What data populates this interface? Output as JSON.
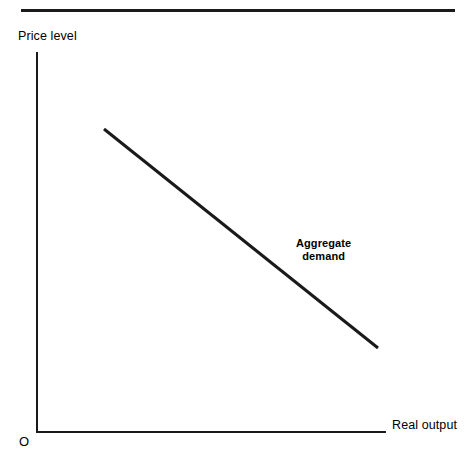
{
  "figure": {
    "background_color": "#ffffff",
    "ink_color": "#1a1a1a",
    "top_rule": "horizontal-rule"
  },
  "labels": {
    "y_axis": "Price level",
    "x_axis": "Real output",
    "origin": "O",
    "curve_line1": "Aggregate",
    "curve_line2": "demand"
  },
  "chart_data": {
    "type": "line",
    "title": "",
    "subtitle": "",
    "xlabel": "Real output",
    "ylabel": "Price level",
    "grid": false,
    "legend": false,
    "legend_position": "inline-annotation",
    "origin_label": "O",
    "axes": {
      "style": "L-shaped",
      "x_axis_pixels": {
        "x_start": 36,
        "x_end": 386,
        "y": 431
      },
      "y_axis_pixels": {
        "y_start": 52,
        "y_end": 431,
        "x": 36
      },
      "ticks": [],
      "tick_labels": [],
      "xlim": [
        0,
        1
      ],
      "ylim": [
        0,
        1
      ]
    },
    "series": [
      {
        "name": "Aggregate demand",
        "kind": "straight-downward-sloping-line",
        "color": "#1a1a1a",
        "line_width_px": 3,
        "annotation": "Aggregate demand",
        "points_pixels": [
          {
            "x": 104,
            "y": 129
          },
          {
            "x": 378,
            "y": 348
          }
        ],
        "points_normalized": [
          {
            "x": 0.19,
            "y": 0.8
          },
          {
            "x": 0.98,
            "y": 0.22
          }
        ],
        "slope_description": "negative"
      }
    ],
    "annotations": [
      {
        "text": "Aggregate demand",
        "bold": true,
        "lines": [
          "Aggregate",
          "demand"
        ],
        "position_pixels": {
          "x": 328,
          "y": 252
        }
      }
    ]
  }
}
